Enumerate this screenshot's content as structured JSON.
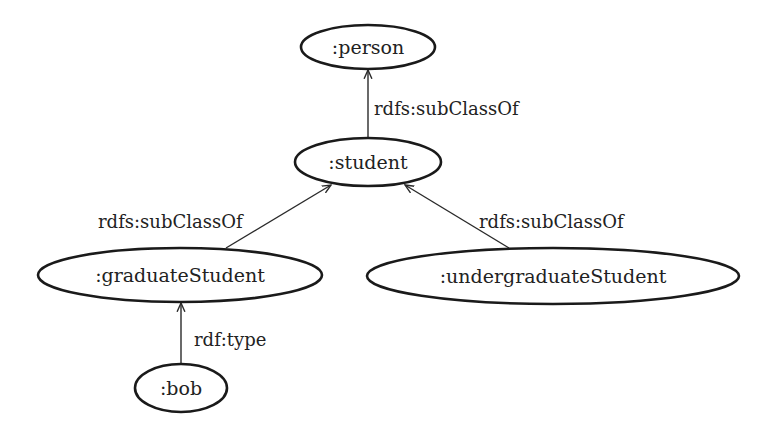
{
  "diagram": {
    "nodes": [
      {
        "id": "person",
        "label": ":person",
        "cx": 368,
        "cy": 47,
        "rx": 67,
        "ry": 22
      },
      {
        "id": "student",
        "label": ":student",
        "cx": 368,
        "cy": 162,
        "rx": 73,
        "ry": 24
      },
      {
        "id": "graduateStudent",
        "label": ":graduateStudent",
        "cx": 180,
        "cy": 275,
        "rx": 142,
        "ry": 27
      },
      {
        "id": "undergraduateStudent",
        "label": ":undergraduateStudent",
        "cx": 553,
        "cy": 276,
        "rx": 186,
        "ry": 28
      },
      {
        "id": "bob",
        "label": ":bob",
        "cx": 181,
        "cy": 388,
        "rx": 46,
        "ry": 24
      }
    ],
    "edges": [
      {
        "from": "student",
        "to": "person",
        "label": "rdfs:subClassOf",
        "x1": 368,
        "y1": 138,
        "x2": 368,
        "y2": 70,
        "lx": 374,
        "ly": 115
      },
      {
        "from": "graduateStudent",
        "to": "student",
        "label": "rdfs:subClassOf",
        "x1": 226,
        "y1": 248,
        "x2": 331,
        "y2": 185,
        "lx": 98,
        "ly": 228
      },
      {
        "from": "undergraduateStudent",
        "to": "student",
        "label": "rdfs:subClassOf",
        "x1": 509,
        "y1": 248,
        "x2": 405,
        "y2": 185,
        "lx": 479,
        "ly": 228
      },
      {
        "from": "bob",
        "to": "graduateStudent",
        "label": "rdf:type",
        "x1": 181,
        "y1": 364,
        "x2": 181,
        "y2": 303,
        "lx": 194,
        "ly": 346
      }
    ]
  }
}
